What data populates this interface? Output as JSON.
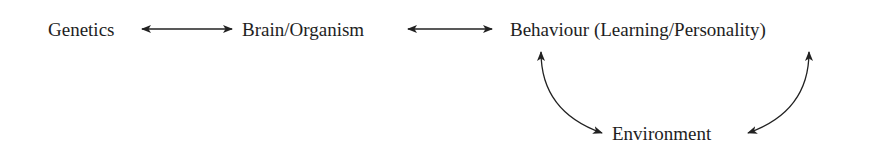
{
  "diagram": {
    "nodes": [
      {
        "id": "genetics",
        "label": "Genetics"
      },
      {
        "id": "brain",
        "label": "Brain/Organism"
      },
      {
        "id": "behaviour",
        "label": "Behaviour (Learning/Personality)"
      },
      {
        "id": "environment",
        "label": "Environment"
      }
    ],
    "edges": [
      {
        "from": "genetics",
        "to": "brain",
        "type": "bidirectional-straight"
      },
      {
        "from": "brain",
        "to": "behaviour",
        "type": "bidirectional-straight"
      },
      {
        "from": "behaviour",
        "to": "environment",
        "type": "bidirectional-curved-left"
      },
      {
        "from": "environment",
        "to": "behaviour",
        "type": "bidirectional-curved-right"
      }
    ],
    "colors": {
      "text": "#1e1e1e",
      "arrow": "#222222",
      "background": "#ffffff"
    }
  }
}
